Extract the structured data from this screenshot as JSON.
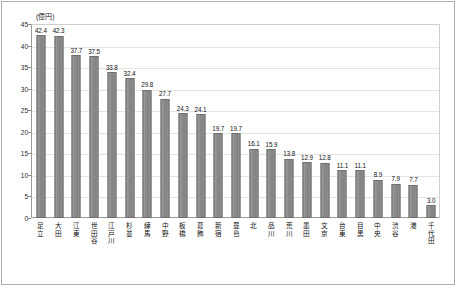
{
  "chart_data": {
    "type": "bar",
    "title": "",
    "subtitle": "",
    "xlabel": "",
    "ylabel": "(億円)",
    "unit_caption": "(億円)",
    "ylim": [
      0,
      45
    ],
    "yticks": [
      0,
      5,
      10,
      15,
      20,
      25,
      30,
      35,
      40,
      45
    ],
    "grid": true,
    "legend": null,
    "bar_color": "#8e8e8e",
    "bar_border_color": "#6f6f6f",
    "categories": [
      "足立",
      "大田",
      "江東",
      "世田谷",
      "江戸川",
      "杉並",
      "練馬",
      "中野",
      "板橋",
      "葛飾",
      "新宿",
      "豊島",
      "北",
      "品川",
      "荒川",
      "墨田",
      "文京",
      "台東",
      "目黒",
      "中央",
      "渋谷",
      "港",
      "千代田"
    ],
    "values": [
      42.4,
      42.3,
      37.7,
      37.5,
      33.8,
      32.4,
      29.8,
      27.7,
      24.3,
      24.1,
      19.7,
      19.7,
      16.1,
      15.9,
      13.8,
      12.9,
      12.8,
      11.1,
      11.1,
      8.9,
      7.9,
      7.7,
      3.0
    ],
    "value_labels": [
      "42.4",
      "42.3",
      "37.7",
      "37.5",
      "33.8",
      "32.4",
      "29.8",
      "27.7",
      "24.3",
      "24.1",
      "19.7",
      "19.7",
      "16.1",
      "15.9",
      "13.8",
      "12.9",
      "12.8",
      "11.1",
      "11.1",
      "8.9",
      "7.9",
      "7.7",
      "3.0"
    ],
    "tick_labels": [
      "0",
      "5",
      "10",
      "15",
      "20",
      "25",
      "30",
      "35",
      "40",
      "45"
    ]
  }
}
